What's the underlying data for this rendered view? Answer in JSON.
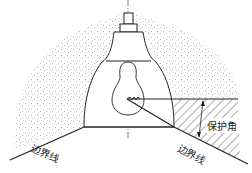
{
  "diagram": {
    "title": "",
    "labels": {
      "boundary_left": "边界线",
      "boundary_right": "边界线",
      "protection_angle": "保护角"
    },
    "colors": {
      "line": "#222222",
      "stipple": "#9a9a9a",
      "hatch": "#333333",
      "background": "#ffffff"
    },
    "components": [
      "lamp-cap",
      "lamp-collar",
      "reflector",
      "bulb",
      "filament",
      "center-axis",
      "light-dome",
      "shielded-region"
    ]
  }
}
